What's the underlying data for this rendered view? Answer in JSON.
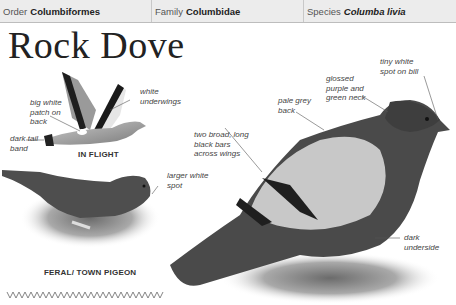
{
  "header": {
    "order_label": "Order",
    "order_value": "Columbiformes",
    "family_label": "Family",
    "family_value": "Columbidae",
    "species_label": "Species",
    "species_value": "Columba livia"
  },
  "title": "Rock Dove",
  "illustrations": {
    "flight": {
      "caption": "IN FLIGHT",
      "labels": {
        "white_patch": "big white patch on back",
        "underwings": "white underwings",
        "tail_band": "dark tail band"
      }
    },
    "feral": {
      "caption": "FERAL/ TOWN PIGEON",
      "labels": {
        "white_spot": "larger white spot"
      }
    },
    "main": {
      "labels": {
        "wing_bars": "two broad, long black bars across wings",
        "back": "pale grey back",
        "neck": "glossed purple and green neck",
        "bill_spot": "tiny white spot on bill",
        "underside": "dark underside"
      }
    }
  },
  "colors": {
    "header_bg": "#ececec",
    "header_border": "#bdbdbd",
    "text": "#222222"
  },
  "footer": {
    "flight_pattern_icon": "zigzag-flight-pattern"
  }
}
